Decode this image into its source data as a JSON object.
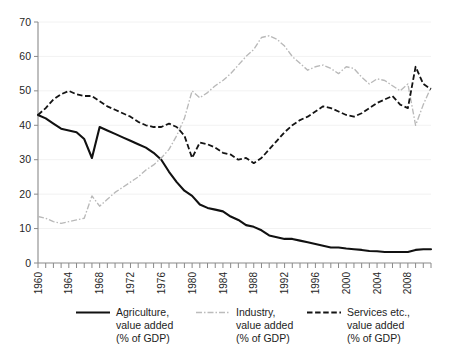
{
  "chart_data": {
    "type": "line",
    "title": "",
    "xlabel": "",
    "ylabel": "",
    "xlim": [
      1960,
      2011
    ],
    "ylim": [
      0,
      70
    ],
    "yticks": [
      0,
      10,
      20,
      30,
      40,
      50,
      60,
      70
    ],
    "xticks": [
      1960,
      1964,
      1968,
      1972,
      1976,
      1980,
      1984,
      1988,
      1992,
      1996,
      2000,
      2004,
      2008
    ],
    "xtick_labels": [
      "1960",
      "1964",
      "1968",
      "1972",
      "1976",
      "1980",
      "1984",
      "1988",
      "1992",
      "1996",
      "2000",
      "2004",
      "2008"
    ],
    "ytick_labels": [
      "0",
      "10",
      "20",
      "30",
      "40",
      "50",
      "60",
      "70"
    ],
    "grid": true,
    "legend_position": "bottom",
    "x": [
      1960,
      1961,
      1962,
      1963,
      1964,
      1965,
      1966,
      1967,
      1968,
      1969,
      1970,
      1971,
      1972,
      1973,
      1974,
      1975,
      1976,
      1977,
      1978,
      1979,
      1980,
      1981,
      1982,
      1983,
      1984,
      1985,
      1986,
      1987,
      1988,
      1989,
      1990,
      1991,
      1992,
      1993,
      1994,
      1995,
      1996,
      1997,
      1998,
      1999,
      2000,
      2001,
      2002,
      2003,
      2004,
      2005,
      2006,
      2007,
      2008,
      2009,
      2010,
      2011
    ],
    "series": [
      {
        "name": "Agriculture, value added (% of GDP)",
        "style": "solid",
        "color": "#111111",
        "values": [
          43.0,
          42.0,
          40.5,
          39.0,
          38.5,
          38.0,
          36.0,
          30.5,
          39.5,
          38.5,
          37.5,
          36.5,
          35.5,
          34.5,
          33.5,
          32.0,
          30.0,
          26.5,
          23.5,
          21.0,
          19.5,
          17.0,
          16.0,
          15.5,
          15.0,
          13.5,
          12.5,
          11.0,
          10.5,
          9.5,
          8.0,
          7.5,
          7.0,
          7.0,
          6.5,
          6.0,
          5.5,
          5.0,
          4.5,
          4.5,
          4.2,
          4.0,
          3.8,
          3.5,
          3.4,
          3.2,
          3.2,
          3.2,
          3.2,
          3.8,
          4.0,
          4.0
        ]
      },
      {
        "name": "Industry, value added (% of GDP)",
        "style": "dash-dot",
        "color": "#bcbcbc",
        "values": [
          13.5,
          13.0,
          12.0,
          11.5,
          12.0,
          12.5,
          13.0,
          19.5,
          16.5,
          18.5,
          20.5,
          22.0,
          23.5,
          25.0,
          27.0,
          28.5,
          30.5,
          33.0,
          37.0,
          42.0,
          50.0,
          48.0,
          49.5,
          51.5,
          53.0,
          55.0,
          57.5,
          60.0,
          62.0,
          65.5,
          66.0,
          65.0,
          63.0,
          60.0,
          58.0,
          56.0,
          57.0,
          57.5,
          56.5,
          55.0,
          57.0,
          56.5,
          54.0,
          52.0,
          53.5,
          53.0,
          51.5,
          50.0,
          52.0,
          40.0,
          46.0,
          51.0
        ]
      },
      {
        "name": "Services etc., value added (% of GDP)",
        "style": "dashed",
        "color": "#141414",
        "values": [
          43.0,
          45.0,
          47.5,
          49.0,
          50.0,
          49.0,
          48.5,
          48.5,
          47.0,
          45.5,
          44.5,
          43.5,
          42.5,
          41.0,
          40.0,
          39.5,
          39.5,
          40.5,
          39.5,
          37.0,
          30.5,
          35.0,
          34.5,
          33.5,
          32.0,
          31.5,
          30.0,
          30.5,
          29.0,
          30.5,
          33.0,
          35.5,
          38.0,
          40.0,
          41.5,
          42.5,
          44.0,
          45.5,
          45.0,
          44.0,
          43.0,
          42.5,
          43.5,
          45.0,
          46.5,
          47.5,
          48.5,
          46.0,
          45.0,
          57.0,
          52.0,
          50.5
        ]
      }
    ]
  },
  "legend": {
    "items": [
      {
        "line1": "Agriculture,",
        "line2": "value added",
        "line3": "(% of GDP)",
        "marker": "solid-line-marker"
      },
      {
        "line1": "Industry,",
        "line2": "value added",
        "line3": "(% of GDP)",
        "marker": "dash-dot-line-marker"
      },
      {
        "line1": "Services etc.,",
        "line2": "value added",
        "line3": "(% of GDP)",
        "marker": "dashed-line-marker"
      }
    ]
  }
}
